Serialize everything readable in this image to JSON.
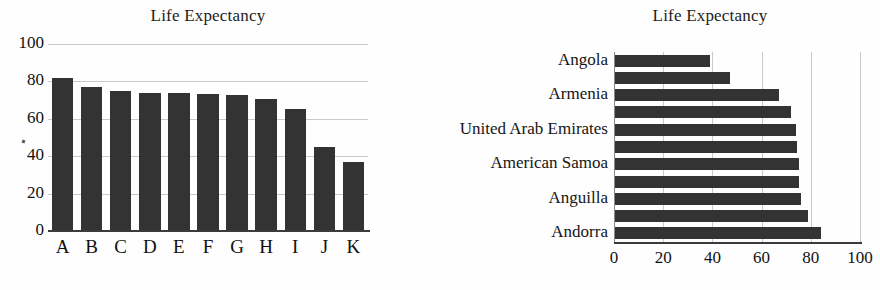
{
  "figure": {
    "background_color": "#fefefe",
    "bar_color": "#333333",
    "gridline_color": "#c9c9c9",
    "text_color": "#1a1a1a"
  },
  "chart_data": [
    {
      "type": "bar",
      "orientation": "vertical",
      "title": "Life Expectancy",
      "xlabel": "",
      "ylabel": "",
      "categories": [
        "A",
        "B",
        "C",
        "D",
        "E",
        "F",
        "G",
        "H",
        "I",
        "J",
        "K"
      ],
      "values": [
        82,
        77,
        75,
        74,
        74,
        73.5,
        73,
        70.5,
        65,
        45,
        37
      ],
      "ylim": [
        0,
        100
      ],
      "yticks": [
        0,
        20,
        40,
        60,
        80,
        100
      ],
      "ytick_labels": [
        "0",
        "20",
        "40",
        "60",
        "80",
        "100"
      ],
      "grid": true,
      "legend": false
    },
    {
      "type": "bar",
      "orientation": "horizontal",
      "title": "Life Expectancy",
      "xlabel": "",
      "ylabel": "",
      "categories": [
        "Angola",
        "",
        "Armenia",
        "",
        "United Arab Emirates",
        "",
        "American Samoa",
        "",
        "Anguilla",
        "",
        "Andorra"
      ],
      "tick_labels_shown": [
        "Angola",
        "Armenia",
        "United Arab Emirates",
        "American Samoa",
        "Anguilla",
        "Andorra"
      ],
      "values": [
        39,
        47,
        67,
        72,
        74,
        74.5,
        75,
        75,
        76,
        79,
        84
      ],
      "xlim": [
        0,
        100
      ],
      "xticks": [
        0,
        20,
        40,
        60,
        80,
        100
      ],
      "xtick_labels": [
        "0",
        "20",
        "40",
        "60",
        "80",
        "100"
      ],
      "grid": true,
      "legend": false
    }
  ]
}
